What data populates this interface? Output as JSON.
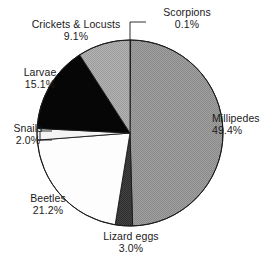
{
  "chart_data": {
    "type": "pie",
    "title": "",
    "xlabel": "",
    "ylabel": "",
    "start_angle_deg": 0,
    "direction": "clockwise",
    "labels_position": "outside",
    "legend": "none",
    "grid": false,
    "categories": [
      "Scorpions",
      "Millipedes",
      "Lizard eggs",
      "Beetles",
      "Snails",
      "Larvae",
      "Crickets & Locusts"
    ],
    "values": [
      0.1,
      49.4,
      3.0,
      21.2,
      2.0,
      15.1,
      9.1
    ],
    "unit": "%",
    "slices": [
      {
        "name": "Scorpions",
        "label": "Scorpions",
        "value": 0.1,
        "percent_text": "0.1%",
        "color": "#8f8f8f",
        "has_leader_line": true
      },
      {
        "name": "Millipedes",
        "label": "Millipedes",
        "value": 49.4,
        "percent_text": "49.4%",
        "color": "#989898",
        "has_leader_line": false
      },
      {
        "name": "Lizard eggs",
        "label": "Lizard eggs",
        "value": 3.0,
        "percent_text": "3.0%",
        "color": "#3a3a3a",
        "has_leader_line": false
      },
      {
        "name": "Beetles",
        "label": "Beetles",
        "value": 21.2,
        "percent_text": "21.2%",
        "color": "#fdfdfd",
        "has_leader_line": false
      },
      {
        "name": "Snails",
        "label": "Snails",
        "value": 2.0,
        "percent_text": "2.0%",
        "color": "#f2f2f2",
        "has_leader_line": true
      },
      {
        "name": "Larvae",
        "label": "Larvae",
        "value": 15.1,
        "percent_text": "15.1%",
        "color": "#060606",
        "has_leader_line": false
      },
      {
        "name": "Crickets & Locusts",
        "label": "Crickets & Locusts",
        "value": 9.1,
        "percent_text": "9.1%",
        "color": "#a8a8a8",
        "has_leader_line": false
      }
    ]
  },
  "labels": {
    "scorpions": {
      "name": "Scorpions",
      "pct": "0.1%"
    },
    "crickets": {
      "name": "Crickets & Locusts",
      "pct": "9.1%"
    },
    "larvae": {
      "name": "Larvae",
      "pct": "15.1%"
    },
    "snails": {
      "name": "Snails",
      "pct": "2.0%"
    },
    "beetles": {
      "name": "Beetles",
      "pct": "21.2%"
    },
    "lizardeggs": {
      "name": "Lizard eggs",
      "pct": "3.0%"
    },
    "millipedes": {
      "name": "Millipedes",
      "pct": "49.4%"
    }
  },
  "colors": {
    "outline": "#1a1a1a",
    "text": "#1a1a1a",
    "background": "#ffffff"
  }
}
